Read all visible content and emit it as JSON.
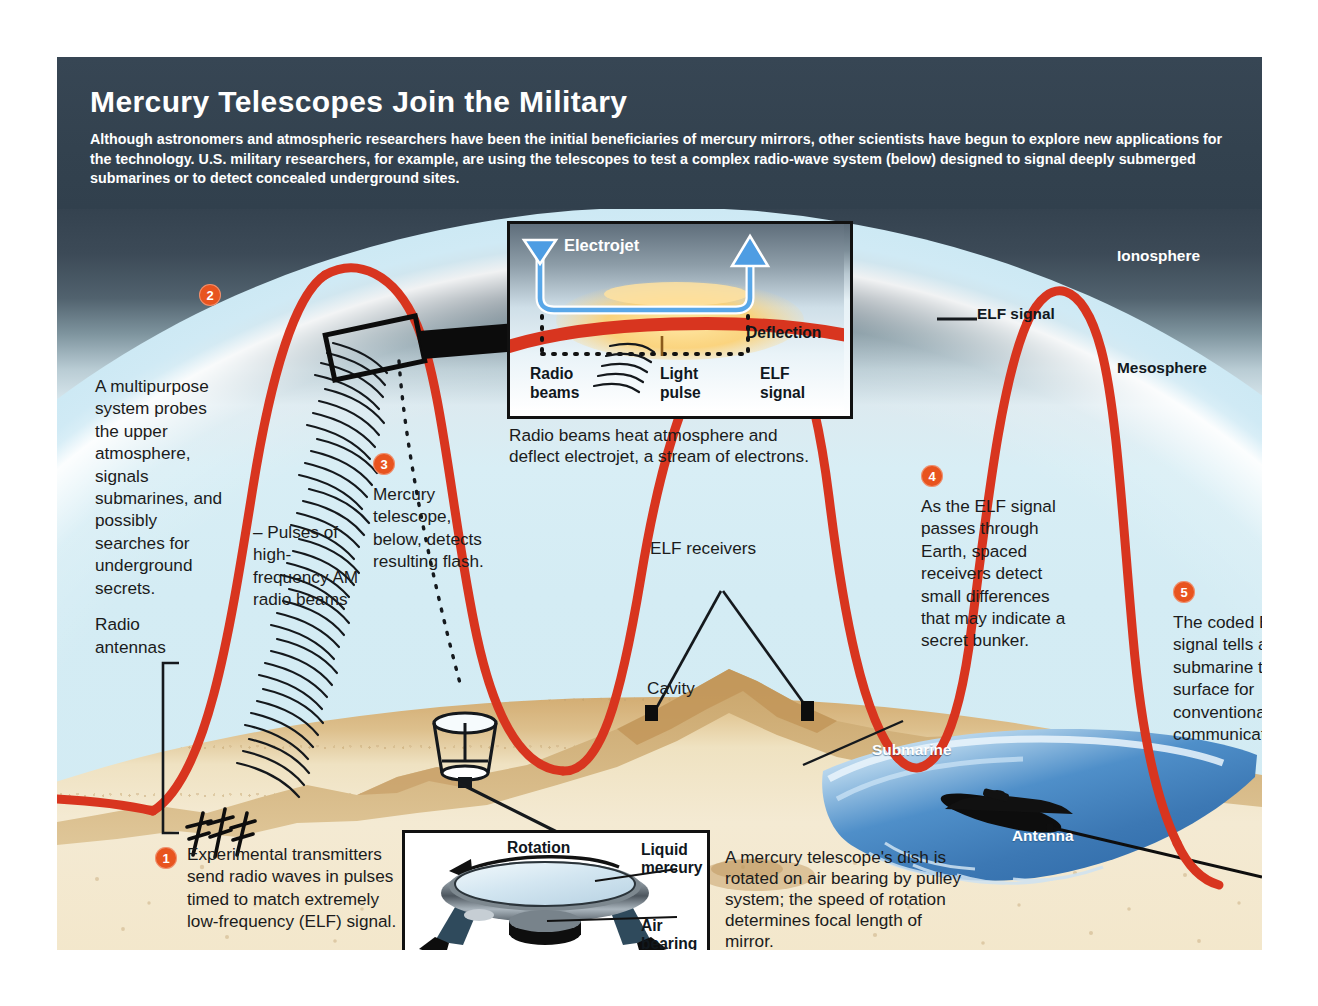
{
  "header": {
    "title": "Mercury Telescopes Join the Military",
    "subtitle": "Although astronomers and atmospheric researchers have been the initial beneficiaries of mercury mirrors, other scientists have begun to explore new applications for the technology. U.S. military researchers, for example, are using the telescopes to test a complex radio-wave system (below) designed to signal deeply submerged submarines or to detect concealed underground sites."
  },
  "atmosphere": {
    "ionosphere": "Ionosphere",
    "mesosphere": "Mesosphere"
  },
  "annotations": {
    "multipurpose": "A multipurpose system probes the upper atmosphere, signals submarines, and possibly searches for underground secrets.",
    "pulses": "– Pulses of high-frequency AM radio beams",
    "radio_antennas": "Radio antennas",
    "elf_signal": "ELF signal",
    "elf_signal_leader": "—",
    "elf_receivers": "ELF receivers",
    "cavity": "Cavity",
    "submarine": "Submarine",
    "antenna": "Antenna"
  },
  "steps": [
    {
      "number": "1",
      "text": "Experimental transmitters send radio waves in pulses timed to match extremely low-frequency (ELF) signal."
    },
    {
      "number": "2",
      "text": ""
    },
    {
      "number": "3",
      "text": "Mercury telescope, below, detects resulting flash."
    },
    {
      "number": "4",
      "text": "As the ELF signal passes through Earth, spaced receivers detect small differences that may indicate a secret bunker."
    },
    {
      "number": "5",
      "text": "The coded ELF signal tells a submarine to surface for conventional communication."
    }
  ],
  "inset_top": {
    "electrojet": "Electrojet",
    "deflection": "Deflection",
    "radio_beams": "Radio beams",
    "light_pulse": "Light pulse",
    "elf_signal": "ELF signal",
    "caption": "Radio beams heat atmosphere and deflect electrojet, a stream of electrons."
  },
  "inset_bottom": {
    "rotation": "Rotation",
    "liquid_mercury": "Liquid mercury",
    "air_bearing": "Air bearing",
    "caption": "A mercury telescope's dish is rotated on air bearing by pulley system; the speed of rotation determines focal length of mirror."
  },
  "colors": {
    "accent_red": "#d8351f",
    "step_badge": "#e8541f",
    "header_bg": "#33424f",
    "sky_top": "#2e3b47",
    "sand": "#f2e6cb",
    "ocean": "#3f7fc0",
    "mantle": "#f6b65c"
  }
}
